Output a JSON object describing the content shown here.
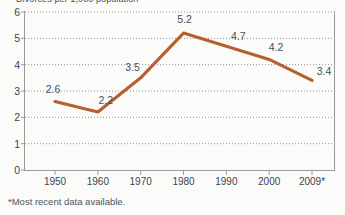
{
  "chart_data": {
    "type": "line",
    "title": "Divorces per 1,000 population",
    "xlabel": "",
    "ylabel": "",
    "x": [
      "1950",
      "1960",
      "1970",
      "1980",
      "1990",
      "2000",
      "2009*"
    ],
    "categories": [
      "1950",
      "1960",
      "1970",
      "1980",
      "1990",
      "2000",
      "2009*"
    ],
    "values": [
      2.6,
      2.2,
      3.5,
      5.2,
      4.7,
      4.2,
      3.4
    ],
    "point_labels": [
      "2.6",
      "2.2",
      "3.5",
      "5.2",
      "4.7",
      "4.2",
      "3.4"
    ],
    "series": [
      {
        "name": "Divorce rate",
        "values": [
          2.6,
          2.2,
          3.5,
          5.2,
          4.7,
          4.2,
          3.4
        ],
        "color": "#b5602f"
      }
    ],
    "ylim": [
      0,
      6
    ],
    "yticks": [
      "0",
      "1",
      "2",
      "3",
      "4",
      "5",
      "6"
    ],
    "xticks": [
      "1950",
      "1960",
      "1970",
      "1980",
      "1990",
      "2000",
      "2009*"
    ],
    "grid": "horizontal-dotted",
    "legend": "none",
    "footnote": "*Most recent data available.",
    "line_color": "#b5602f",
    "grid_color": "#8d9298",
    "axis_color": "#9a9a9a",
    "text_color": "#46505c"
  }
}
